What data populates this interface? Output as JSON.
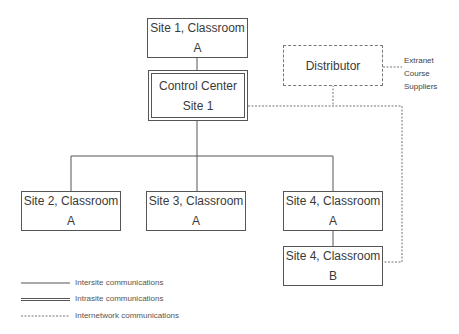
{
  "diagram": {
    "nodes": {
      "site1_classroom_a": "Site 1, Classroom A",
      "control_center_line1": "Control Center",
      "control_center_line2": "Site 1",
      "distributor": "Distributor",
      "site2_classroom_a": "Site 2, Classroom A",
      "site3_classroom_a": "Site 3, Classroom A",
      "site4_classroom_a": "Site 4, Classroom A",
      "site4_classroom_b": "Site 4, Classroom B"
    },
    "extranet_note": [
      "Extranet",
      "Course",
      "Suppliers"
    ],
    "legend": [
      {
        "style": "solid",
        "label": "Intersite communications"
      },
      {
        "style": "double",
        "label": "Intrasite communications"
      },
      {
        "style": "dashed",
        "label": "Internetwork communications"
      }
    ],
    "colors": {
      "line": "#555555",
      "dashed": "#777777",
      "text": "#3a3a3a"
    }
  }
}
